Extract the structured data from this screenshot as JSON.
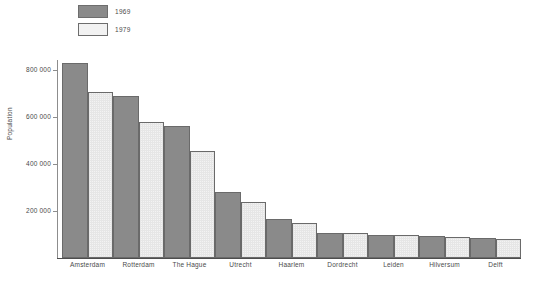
{
  "chart_data": {
    "type": "bar",
    "title": "",
    "xlabel": "",
    "ylabel": "Population",
    "ylim": [
      0,
      850000
    ],
    "yticks": [
      200000,
      400000,
      600000,
      800000
    ],
    "ytick_labels": [
      "200 000",
      "400 000",
      "600 000",
      "800 000"
    ],
    "grid": false,
    "legend_position": "top-left",
    "categories": [
      "Amsterdam",
      "Rotterdam",
      "The Hague",
      "Utrecht",
      "Haarlem",
      "Dordrecht",
      "Leiden",
      "Hilversum",
      "Delft"
    ],
    "series": [
      {
        "name": "1969",
        "color": "#8a8a8a",
        "values": [
          830000,
          690000,
          560000,
          280000,
          165000,
          105000,
          100000,
          95000,
          85000
        ]
      },
      {
        "name": "1979",
        "color": "#f3f3f3",
        "values": [
          705000,
          580000,
          455000,
          240000,
          150000,
          105000,
          100000,
          90000,
          80000
        ]
      }
    ]
  },
  "legend": {
    "items": [
      {
        "label": "1969",
        "swatch": "dark-gray-swatch"
      },
      {
        "label": "1979",
        "swatch": "light-gray-swatch"
      }
    ]
  },
  "caption": {
    "text": ""
  }
}
